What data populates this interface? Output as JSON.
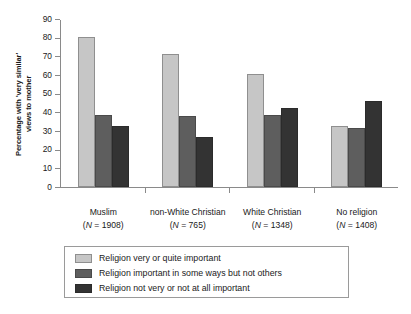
{
  "chart_data": {
    "type": "bar",
    "title": "",
    "xlabel": "",
    "ylabel": "Percentage with 'very similar'\nviews to mother",
    "ylim": [
      0,
      90
    ],
    "yticks": [
      0,
      10,
      20,
      30,
      40,
      50,
      60,
      70,
      80,
      90
    ],
    "grid": false,
    "legend_position": "bottom",
    "categories": [
      "Muslim",
      "non-White Christian",
      "White Christian",
      "No religion"
    ],
    "category_counts": [
      "(N = 1908)",
      "(N = 765)",
      "(N = 1348)",
      "(N = 1408)"
    ],
    "category_n_values": [
      1908,
      765,
      1348,
      1408
    ],
    "series": [
      {
        "name": "Religion very or quite important",
        "color": "#c6c6c6",
        "values": [
          80.3,
          71.4,
          60.3,
          32.8
        ]
      },
      {
        "name": "Religion important in some ways but not others",
        "color": "#5e5e5e",
        "values": [
          38.6,
          38.0,
          38.4,
          31.6
        ]
      },
      {
        "name": "Religion not very or not at all important",
        "color": "#333333",
        "values": [
          32.8,
          26.9,
          42.4,
          45.9
        ]
      }
    ]
  },
  "axis": {
    "tick_labels": [
      "0",
      "10",
      "20",
      "30",
      "40",
      "50",
      "60",
      "70",
      "80",
      "90"
    ],
    "y_title_line1": "Percentage with 'very similar'",
    "y_title_line2": "views to mother"
  },
  "legend": {
    "items": [
      {
        "label": "Religion very or quite important",
        "swatch": "light-gray-swatch"
      },
      {
        "label": "Religion important in some ways but not others",
        "swatch": "medium-gray-swatch"
      },
      {
        "label": "Religion not very or not at all important",
        "swatch": "dark-gray-swatch"
      }
    ]
  }
}
